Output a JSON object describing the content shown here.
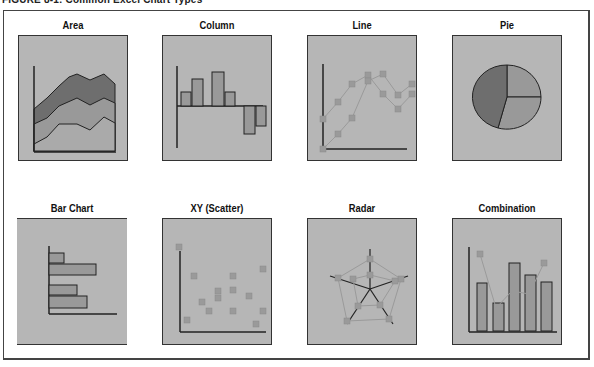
{
  "figure": {
    "title": "FIGURE 8-1: Common Excel Chart Types"
  },
  "cells": [
    {
      "label": "Area",
      "type": "area"
    },
    {
      "label": "Column",
      "type": "column"
    },
    {
      "label": "Line",
      "type": "line"
    },
    {
      "label": "Pie",
      "type": "pie"
    },
    {
      "label": "Bar Chart",
      "type": "bar"
    },
    {
      "label": "XY (Scatter)",
      "type": "scatter"
    },
    {
      "label": "Radar",
      "type": "radar"
    },
    {
      "label": "Combination",
      "type": "combination"
    }
  ],
  "colors": {
    "panel_bg": "#b6b6b6",
    "dark_fill": "#6e6e6e",
    "mid_fill": "#999999",
    "light_fill": "#aaaaaa",
    "marker": "#9a9a9a",
    "line": "#222222"
  }
}
